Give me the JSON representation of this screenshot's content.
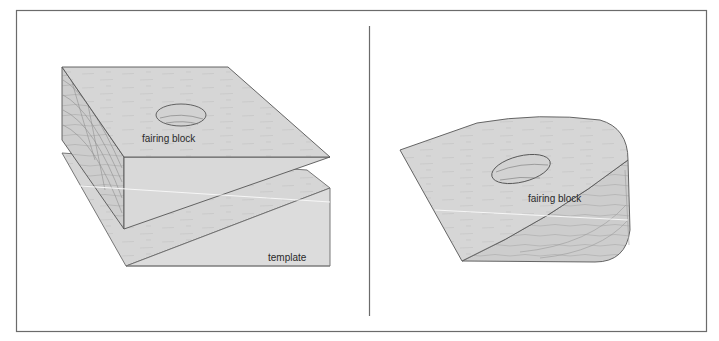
{
  "figure": {
    "panels": [
      {
        "id": "left",
        "description": "Fairing block resting on template before shaping",
        "labels": {
          "block": "fairing block",
          "template": "template"
        }
      },
      {
        "id": "right",
        "description": "Fairing block after being shaped to the template outline",
        "labels": {
          "block": "fairing block"
        }
      }
    ],
    "colors": {
      "frame": "#6b6b6b",
      "surface": "#d6d6d6",
      "surface_light": "#dedede",
      "side": "#cfcfcf",
      "edge": "#555555",
      "grain": "#b5b5b5",
      "highlight": "#f4f4f4",
      "text": "#2a2a2a"
    }
  }
}
